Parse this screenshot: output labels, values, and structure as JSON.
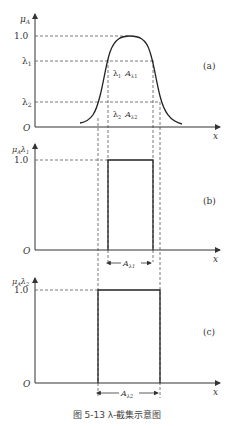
{
  "panels": [
    {
      "id": "a",
      "label": "(a)",
      "y_axis_label": "μA",
      "x_axis_label": "x",
      "origin_label": "O",
      "ticks": [
        "1.0",
        "λ1",
        "λ2"
      ],
      "annotations": [
        "λ1  Aλ1",
        "λ2  Aλ2"
      ]
    },
    {
      "id": "b",
      "label": "(b)",
      "y_axis_label": "μAλ1",
      "x_axis_label": "x",
      "origin_label": "O",
      "ticks": [
        "1.0"
      ],
      "span_label": "Aλ1"
    },
    {
      "id": "c",
      "label": "(c)",
      "y_axis_label": "μAλ2",
      "x_axis_label": "x",
      "origin_label": "O",
      "ticks": [
        "1.0"
      ],
      "span_label": "Aλ2"
    }
  ],
  "caption": "图 5-13   λ-截集示意图",
  "labels": {
    "a": "(a)",
    "b": "(b)",
    "c": "(c)",
    "one": "1.0",
    "lam1": "λ",
    "lam2": "λ",
    "sub1": "1",
    "sub2": "2",
    "O": "O",
    "x": "x",
    "mu": "μ",
    "A": "A"
  }
}
